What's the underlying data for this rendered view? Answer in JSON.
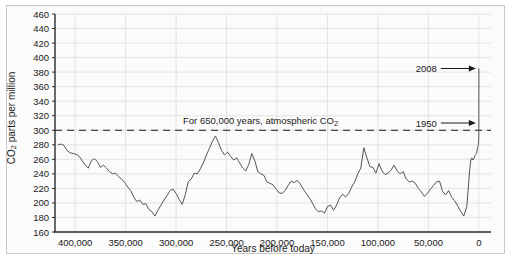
{
  "chart_data": {
    "type": "line",
    "title": "",
    "xlabel": "Years before today",
    "ylabel": "CO2 parts per million",
    "ylabel_display": "CO₂ parts per million",
    "xlim": [
      420000,
      -12000
    ],
    "ylim": [
      160,
      460
    ],
    "grid": true,
    "legend": false,
    "y_ticks": [
      160,
      180,
      200,
      220,
      240,
      260,
      280,
      300,
      320,
      340,
      360,
      380,
      400,
      420,
      440,
      460
    ],
    "y_tick_labels": [
      "160",
      "180",
      "200",
      "220",
      "240",
      "260",
      "280",
      "300",
      "320",
      "340",
      "360",
      "380",
      "400",
      "420",
      "440",
      "460"
    ],
    "x_ticks": [
      400000,
      350000,
      300000,
      250000,
      200000,
      150000,
      100000,
      50000,
      0
    ],
    "x_tick_labels": [
      "400,000",
      "350,000",
      "300,000",
      "250,000",
      "200,000",
      "150,000",
      "100,000",
      "50,000",
      "0"
    ],
    "reference_line": {
      "value": 300,
      "style": "dashed",
      "label": "For 650,000 years, atmospheric CO2",
      "label_display": "For 650,000 years, atmospheric CO₂"
    },
    "annotations": [
      {
        "text": "2008",
        "value_ppm": 385,
        "year": 2008
      },
      {
        "text": "1950",
        "value_ppm": 310,
        "year": 1950
      }
    ],
    "series": [
      {
        "name": "Atmospheric CO2 (ice core record)",
        "color": "#555555",
        "points": [
          [
            417000,
            280
          ],
          [
            414000,
            281
          ],
          [
            411000,
            279
          ],
          [
            408000,
            272
          ],
          [
            405000,
            269
          ],
          [
            402000,
            268
          ],
          [
            399000,
            267
          ],
          [
            396000,
            264
          ],
          [
            393000,
            258
          ],
          [
            390000,
            252
          ],
          [
            387000,
            248
          ],
          [
            384000,
            258
          ],
          [
            381000,
            261
          ],
          [
            378000,
            257
          ],
          [
            375000,
            249
          ],
          [
            372000,
            252
          ],
          [
            369000,
            248
          ],
          [
            366000,
            243
          ],
          [
            363000,
            240
          ],
          [
            360000,
            241
          ],
          [
            357000,
            236
          ],
          [
            354000,
            233
          ],
          [
            351000,
            228
          ],
          [
            348000,
            222
          ],
          [
            345000,
            217
          ],
          [
            342000,
            208
          ],
          [
            339000,
            202
          ],
          [
            336000,
            204
          ],
          [
            333000,
            198
          ],
          [
            330000,
            199
          ],
          [
            327000,
            191
          ],
          [
            324000,
            188
          ],
          [
            321000,
            182
          ],
          [
            318000,
            190
          ],
          [
            315000,
            197
          ],
          [
            312000,
            204
          ],
          [
            309000,
            210
          ],
          [
            306000,
            217
          ],
          [
            303000,
            219
          ],
          [
            300000,
            213
          ],
          [
            297000,
            205
          ],
          [
            294000,
            198
          ],
          [
            291000,
            211
          ],
          [
            288000,
            229
          ],
          [
            285000,
            233
          ],
          [
            282000,
            241
          ],
          [
            279000,
            240
          ],
          [
            276000,
            247
          ],
          [
            273000,
            255
          ],
          [
            270000,
            266
          ],
          [
            267000,
            275
          ],
          [
            264000,
            285
          ],
          [
            261000,
            292
          ],
          [
            258000,
            283
          ],
          [
            255000,
            272
          ],
          [
            252000,
            266
          ],
          [
            249000,
            270
          ],
          [
            246000,
            264
          ],
          [
            243000,
            259
          ],
          [
            240000,
            262
          ],
          [
            237000,
            255
          ],
          [
            234000,
            248
          ],
          [
            231000,
            244
          ],
          [
            228000,
            253
          ],
          [
            225000,
            268
          ],
          [
            222000,
            258
          ],
          [
            219000,
            243
          ],
          [
            216000,
            240
          ],
          [
            213000,
            238
          ],
          [
            210000,
            229
          ],
          [
            207000,
            227
          ],
          [
            204000,
            225
          ],
          [
            201000,
            219
          ],
          [
            198000,
            214
          ],
          [
            195000,
            213
          ],
          [
            192000,
            217
          ],
          [
            189000,
            224
          ],
          [
            186000,
            230
          ],
          [
            183000,
            228
          ],
          [
            180000,
            231
          ],
          [
            177000,
            226
          ],
          [
            174000,
            219
          ],
          [
            171000,
            213
          ],
          [
            168000,
            207
          ],
          [
            165000,
            200
          ],
          [
            162000,
            192
          ],
          [
            159000,
            188
          ],
          [
            156000,
            189
          ],
          [
            153000,
            186
          ],
          [
            150000,
            195
          ],
          [
            147000,
            197
          ],
          [
            144000,
            190
          ],
          [
            141000,
            197
          ],
          [
            138000,
            207
          ],
          [
            135000,
            212
          ],
          [
            132000,
            208
          ],
          [
            129000,
            213
          ],
          [
            126000,
            222
          ],
          [
            123000,
            229
          ],
          [
            120000,
            240
          ],
          [
            117000,
            248
          ],
          [
            114000,
            276
          ],
          [
            111000,
            262
          ],
          [
            108000,
            250
          ],
          [
            105000,
            249
          ],
          [
            102000,
            241
          ],
          [
            99000,
            254
          ],
          [
            96000,
            244
          ],
          [
            93000,
            239
          ],
          [
            90000,
            241
          ],
          [
            87000,
            245
          ],
          [
            84000,
            252
          ],
          [
            81000,
            244
          ],
          [
            78000,
            240
          ],
          [
            75000,
            243
          ],
          [
            72000,
            233
          ],
          [
            69000,
            229
          ],
          [
            66000,
            230
          ],
          [
            63000,
            227
          ],
          [
            60000,
            220
          ],
          [
            57000,
            215
          ],
          [
            54000,
            209
          ],
          [
            51000,
            213
          ],
          [
            48000,
            219
          ],
          [
            45000,
            224
          ],
          [
            42000,
            229
          ],
          [
            39000,
            230
          ],
          [
            36000,
            216
          ],
          [
            33000,
            211
          ],
          [
            30000,
            217
          ],
          [
            27000,
            208
          ],
          [
            24000,
            203
          ],
          [
            21000,
            196
          ],
          [
            18000,
            188
          ],
          [
            15000,
            182
          ],
          [
            12000,
            195
          ],
          [
            11000,
            212
          ],
          [
            10000,
            230
          ],
          [
            9000,
            247
          ],
          [
            8000,
            259
          ],
          [
            7000,
            262
          ],
          [
            6000,
            259
          ],
          [
            5000,
            261
          ],
          [
            4000,
            265
          ],
          [
            3000,
            267
          ],
          [
            2000,
            270
          ],
          [
            1500,
            275
          ],
          [
            1000,
            277
          ],
          [
            500,
            280
          ],
          [
            200,
            285
          ],
          [
            100,
            295
          ],
          [
            58,
            311
          ],
          [
            40,
            320
          ],
          [
            20,
            340
          ],
          [
            8,
            365
          ],
          [
            0,
            385
          ]
        ]
      }
    ]
  },
  "axes": {
    "y_axis_name": "co2-axis",
    "x_axis_name": "time-axis"
  }
}
